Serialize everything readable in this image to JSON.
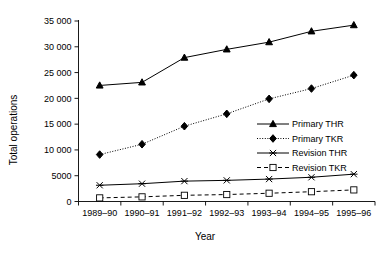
{
  "chart_data": {
    "type": "line",
    "title": "",
    "xlabel": "Year",
    "ylabel": "Total operations",
    "categories": [
      "1989–90",
      "1990–91",
      "1991–92",
      "1992–93",
      "1993–94",
      "1994–95",
      "1995–96"
    ],
    "yticks": [
      "0",
      "5000",
      "10 000",
      "15 000",
      "20 000",
      "25 000",
      "30 000",
      "35 000"
    ],
    "ytick_values": [
      0,
      5000,
      10000,
      15000,
      20000,
      25000,
      30000,
      35000
    ],
    "ylim": [
      0,
      35000
    ],
    "grid": false,
    "legend_position": "center-right",
    "series": [
      {
        "name": "Primary THR",
        "marker": "filled-triangle",
        "line_style": "solid",
        "color": "#000000",
        "values": [
          22500,
          23100,
          27900,
          29500,
          30900,
          33000,
          34200
        ]
      },
      {
        "name": "Primary TKR",
        "marker": "filled-diamond",
        "line_style": "dotted",
        "color": "#000000",
        "values": [
          9100,
          11100,
          14600,
          17000,
          19900,
          21900,
          24500
        ]
      },
      {
        "name": "Revision THR",
        "marker": "cross-star",
        "line_style": "solid",
        "color": "#000000",
        "values": [
          3150,
          3450,
          3950,
          4100,
          4350,
          4700,
          5300
        ]
      },
      {
        "name": "Revision TKR",
        "marker": "open-square",
        "line_style": "dashed",
        "color": "#000000",
        "values": [
          700,
          900,
          1200,
          1350,
          1600,
          1900,
          2250
        ]
      }
    ]
  },
  "legend": {
    "items": [
      {
        "label": "Primary THR"
      },
      {
        "label": "Primary TKR"
      },
      {
        "label": "Revision THR"
      },
      {
        "label": "Revision TKR"
      }
    ]
  }
}
